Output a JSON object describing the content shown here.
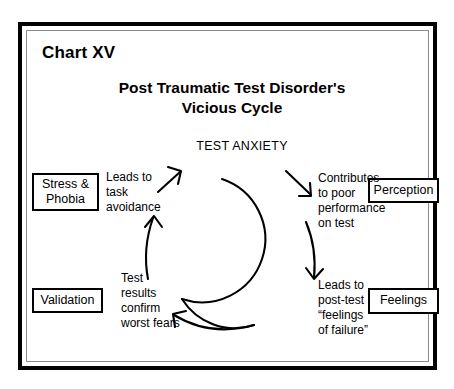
{
  "chart_number": "Chart XV",
  "title": "Post Traumatic Test Disorder's\nVicious Cycle",
  "cycle": {
    "hub_label": "TEST ANXIETY",
    "stages": [
      {
        "box": "Stress &\nPhobia",
        "annotation": "Leads to\ntask\navoidance"
      },
      {
        "box": "Perception",
        "annotation": "Contributes\nto poor\nperformance\non test"
      },
      {
        "box": "Feelings",
        "annotation": "Leads to\npost-test\n“feelings\nof failure”"
      },
      {
        "box": "Validation",
        "annotation": "Test\nresults\nconfirm\nworst fears"
      }
    ]
  },
  "colors": {
    "ink": "#000000",
    "page": "#ffffff",
    "inner_rule": "#8a8a8a"
  }
}
